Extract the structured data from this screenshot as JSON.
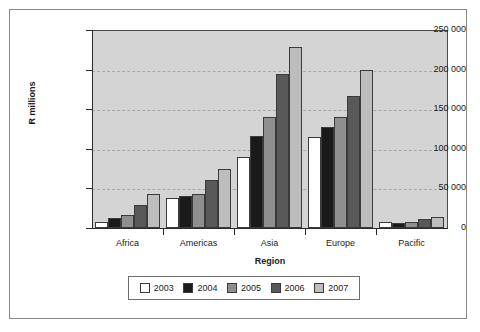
{
  "chart_data": {
    "type": "bar",
    "title": "",
    "subtitle": "",
    "xlabel": "Region",
    "ylabel": "R millions",
    "categories": [
      "Africa",
      "Americas",
      "Asia",
      "Europe",
      "Pacific"
    ],
    "series": [
      {
        "name": "2003",
        "color": "#ffffff",
        "values": [
          7000,
          38000,
          90000,
          115000,
          7000
        ]
      },
      {
        "name": "2004",
        "color": "#1a1a1a",
        "values": [
          12000,
          41000,
          116000,
          128000,
          6500
        ]
      },
      {
        "name": "2005",
        "color": "#8f8f8f",
        "values": [
          16000,
          43000,
          140000,
          140000,
          7000
        ]
      },
      {
        "name": "2006",
        "color": "#595959",
        "values": [
          29000,
          60000,
          194000,
          167000,
          11000
        ]
      },
      {
        "name": "2007",
        "color": "#bdbdbd",
        "values": [
          43000,
          75000,
          229000,
          200000,
          13500
        ]
      }
    ],
    "ylim": [
      0,
      250000
    ],
    "ytick_values": [
      0,
      50000,
      100000,
      150000,
      200000,
      250000
    ],
    "ytick_labels": [
      "0",
      "50 000",
      "100 000",
      "150 000",
      "200 000",
      "250 000"
    ],
    "grid": true,
    "legend_position": "bottom",
    "plot_background": "#d4d4d4",
    "figure_background": "#ffffff",
    "border_color": "#8a8a8a"
  }
}
